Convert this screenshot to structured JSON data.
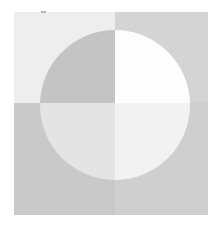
{
  "figure": {
    "canvas": {
      "width": 223,
      "height": 231,
      "background_color": "#ffffff"
    },
    "panel": {
      "label": "square-panel",
      "x": 14,
      "y": 12,
      "width": 194,
      "height": 203
    },
    "split": {
      "label": "quadrant-cross",
      "vertical_x": 115,
      "horizontal_y": 103
    },
    "circle": {
      "label": "circle",
      "center_x": 115,
      "center_y": 105,
      "radius": 75,
      "left": 40,
      "right": 190,
      "top": 18,
      "bottom": 192
    },
    "quadrants": [
      {
        "name": "top-left",
        "square_color": "#eeeeee",
        "circle_color": "#c4c4c4"
      },
      {
        "name": "top-right",
        "square_color": "#d4d4d4",
        "circle_color": "#fdfdfd"
      },
      {
        "name": "bottom-left",
        "square_color": "#c9c9c9",
        "circle_color": "#e4e4e4"
      },
      {
        "name": "bottom-right",
        "square_color": "#cfcfcf",
        "circle_color": "#f2f2f2"
      }
    ],
    "marks": [
      {
        "name": "corner-speck",
        "x": 41,
        "y": 11,
        "width": 5,
        "height": 2,
        "color": "#b9b9b9"
      }
    ]
  }
}
